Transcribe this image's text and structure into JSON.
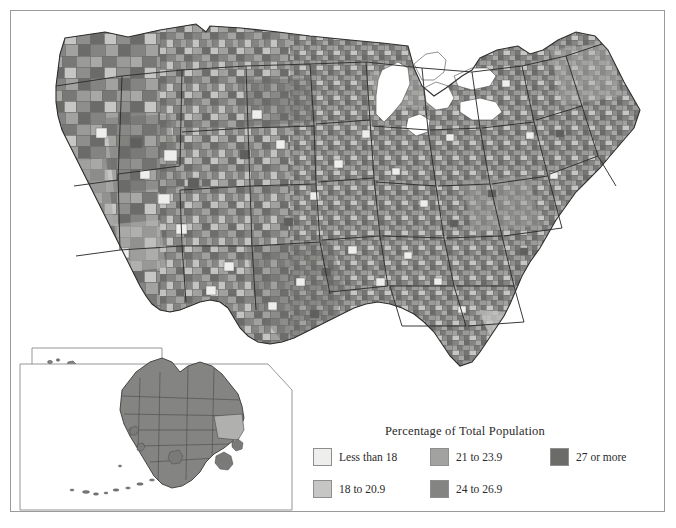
{
  "figure": {
    "type": "choropleth-map",
    "frame": true
  },
  "legend": {
    "title": "Percentage of Total Population",
    "items": [
      {
        "label": "Less than 18",
        "color": "#eeeeec",
        "column": 0,
        "row": 0
      },
      {
        "label": "18 to 20.9",
        "color": "#c6c6c4",
        "column": 0,
        "row": 1
      },
      {
        "label": "21 to 23.9",
        "color": "#a2a2a0",
        "column": 1,
        "row": 0
      },
      {
        "label": "24 to 26.9",
        "color": "#848482",
        "column": 1,
        "row": 1
      },
      {
        "label": "27 or more",
        "color": "#6b6b69",
        "column": 2,
        "row": 0
      }
    ]
  },
  "insets": [
    {
      "name": "hawaii-inset"
    },
    {
      "name": "alaska-inset"
    }
  ],
  "colors": {
    "bin1": "#eeeeec",
    "bin2": "#c6c6c4",
    "bin3": "#a2a2a0",
    "bin4": "#848482",
    "bin5": "#6b6b69",
    "water": "#ffffff",
    "county_stroke": "#6e6e6e",
    "state_stroke": "#2e2e2e",
    "frame_stroke": "#9a9a9a",
    "text": "#2a2a2a"
  }
}
